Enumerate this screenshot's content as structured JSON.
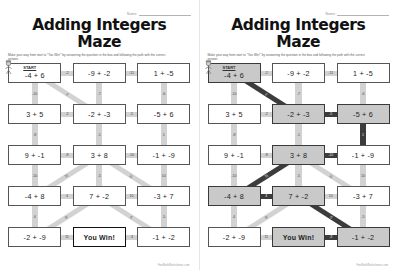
{
  "worksheet": {
    "title": "Adding Integers Maze",
    "name_label": "Name:",
    "instructions": "Make your way from start to \"You Win!\" by answering the question in the box and following the path with the correct answer.",
    "footer": "FunMathWorksheets.com",
    "start_label": "START",
    "win_label": "You Win!",
    "accent_path_color": "#3c3c3c",
    "connector_color": "#d2d2d2",
    "highlight_cell_color": "#c9c9c9"
  },
  "pages": [
    {
      "id": "student",
      "answer_key": false
    },
    {
      "id": "answer-key",
      "answer_key": true
    }
  ],
  "maze": {
    "rows": 5,
    "cols": 3,
    "cells": [
      {
        "id": "r1c1",
        "text": "-4 + 6",
        "start": true,
        "win": false,
        "on_path": true
      },
      {
        "id": "r1c2",
        "text": "-9 + -2",
        "start": false,
        "win": false,
        "on_path": false
      },
      {
        "id": "r1c3",
        "text": "1 + -5",
        "start": false,
        "win": false,
        "on_path": false
      },
      {
        "id": "r2c1",
        "text": "3 + 5",
        "start": false,
        "win": false,
        "on_path": false
      },
      {
        "id": "r2c2",
        "text": "-2 + -3",
        "start": false,
        "win": false,
        "on_path": true
      },
      {
        "id": "r2c3",
        "text": "-5 + 6",
        "start": false,
        "win": false,
        "on_path": true
      },
      {
        "id": "r3c1",
        "text": "9 + -1",
        "start": false,
        "win": false,
        "on_path": false
      },
      {
        "id": "r3c2",
        "text": "3 + 8",
        "start": false,
        "win": false,
        "on_path": true
      },
      {
        "id": "r3c3",
        "text": "-1 + -9",
        "start": false,
        "win": false,
        "on_path": false
      },
      {
        "id": "r4c1",
        "text": "-4 + 8",
        "start": false,
        "win": false,
        "on_path": true
      },
      {
        "id": "r4c2",
        "text": "7 + -2",
        "start": false,
        "win": false,
        "on_path": true
      },
      {
        "id": "r4c3",
        "text": "-3 + 7",
        "start": false,
        "win": false,
        "on_path": false
      },
      {
        "id": "r5c1",
        "text": "-2 + -9",
        "start": false,
        "win": false,
        "on_path": false
      },
      {
        "id": "r5c2",
        "text": "You Win!",
        "start": false,
        "win": true,
        "on_path": true
      },
      {
        "id": "r5c3",
        "text": "-1 + -2",
        "start": false,
        "win": false,
        "on_path": true
      }
    ],
    "connectors": [
      {
        "id": "h-r1-c1c2",
        "value": "-2",
        "kind": "h",
        "on_path": false
      },
      {
        "id": "h-r1-c2c3",
        "value": "-11",
        "kind": "h",
        "on_path": false
      },
      {
        "id": "v-c1-r1r2",
        "value": "-10",
        "kind": "v",
        "on_path": false
      },
      {
        "id": "v-c2-r1r2",
        "value": "-7",
        "kind": "v",
        "on_path": false
      },
      {
        "id": "v-c3-r1r2",
        "value": "-6",
        "kind": "v",
        "on_path": false
      },
      {
        "id": "d-r1c1-r2c2",
        "value": "2",
        "kind": "d",
        "on_path": true
      },
      {
        "id": "h-r2-c1c2",
        "value": "-2",
        "kind": "h",
        "on_path": false
      },
      {
        "id": "h-r2-c2c3",
        "value": "-5",
        "kind": "h",
        "on_path": true
      },
      {
        "id": "v-c1-r2r3",
        "value": "-8",
        "kind": "v",
        "on_path": false
      },
      {
        "id": "v-c2-r2r3",
        "value": "-1",
        "kind": "v",
        "on_path": false
      },
      {
        "id": "v-c3-r2r3",
        "value": "1",
        "kind": "v",
        "on_path": true
      },
      {
        "id": "h-r3-c1c2",
        "value": "-8",
        "kind": "h",
        "on_path": false
      },
      {
        "id": "h-r3-c2c3",
        "value": "-10",
        "kind": "h",
        "on_path": true
      },
      {
        "id": "v-c1-r3r4",
        "value": "-10",
        "kind": "v",
        "on_path": false
      },
      {
        "id": "v-c2-r3r4",
        "value": "-5",
        "kind": "v",
        "on_path": false
      },
      {
        "id": "v-c3-r3r4",
        "value": "10",
        "kind": "v",
        "on_path": false
      },
      {
        "id": "d-r3c2-r4c1",
        "value": "11",
        "kind": "d",
        "on_path": true
      },
      {
        "id": "d-r3c2-r4c3",
        "value": "11",
        "kind": "d",
        "on_path": false
      },
      {
        "id": "h-r4-c1c2",
        "value": "4",
        "kind": "h",
        "on_path": true
      },
      {
        "id": "h-r4-c2c3",
        "value": "10",
        "kind": "h",
        "on_path": false
      },
      {
        "id": "v-c1-r4r5",
        "value": "4",
        "kind": "v",
        "on_path": false
      },
      {
        "id": "v-c3-r4r5",
        "value": "-5",
        "kind": "v",
        "on_path": false
      },
      {
        "id": "d-r4c2-r5c1",
        "value": "-9",
        "kind": "d",
        "on_path": false
      },
      {
        "id": "d-r4c2-r5c3",
        "value": "5",
        "kind": "d",
        "on_path": true
      },
      {
        "id": "h-r5-c1c2",
        "value": "11",
        "kind": "h",
        "on_path": false
      },
      {
        "id": "h-r5-c2c3",
        "value": "-3",
        "kind": "h",
        "on_path": true
      }
    ]
  }
}
